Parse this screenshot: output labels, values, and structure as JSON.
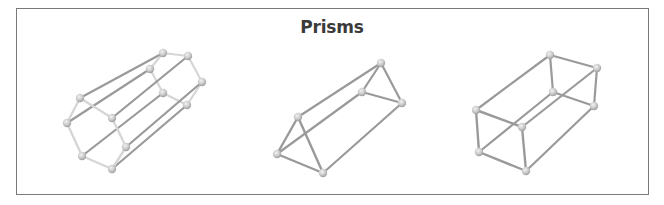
{
  "title": "Prisms",
  "colors": {
    "border": "#7a7a7a",
    "rod": "#9a9a9a",
    "rod_light": "#d6d6d6",
    "ball": "#c8c8c8",
    "title": "#3a3a3a"
  },
  "figures": [
    {
      "name": "Hexagonal prism",
      "back": [
        [
          163,
          53
        ],
        [
          188,
          56
        ],
        [
          202,
          82
        ],
        [
          187,
          105
        ],
        [
          163,
          93
        ],
        [
          150,
          69
        ]
      ],
      "front": [
        [
          80,
          98
        ],
        [
          112,
          118
        ],
        [
          126,
          147
        ],
        [
          112,
          169
        ],
        [
          82,
          156
        ],
        [
          67,
          123
        ]
      ],
      "face_style": "light"
    },
    {
      "name": "Triangular prism",
      "back": [
        [
          381,
          63
        ],
        [
          402,
          103
        ],
        [
          362,
          92
        ]
      ],
      "front": [
        [
          298,
          117
        ],
        [
          323,
          173
        ],
        [
          277,
          154
        ]
      ],
      "face_style": "dark"
    },
    {
      "name": "Rectangular prism",
      "back": [
        [
          550,
          55
        ],
        [
          597,
          68
        ],
        [
          594,
          106
        ],
        [
          553,
          92
        ]
      ],
      "front": [
        [
          476,
          110
        ],
        [
          522,
          127
        ],
        [
          526,
          171
        ],
        [
          479,
          152
        ]
      ],
      "face_style": "dark"
    }
  ]
}
